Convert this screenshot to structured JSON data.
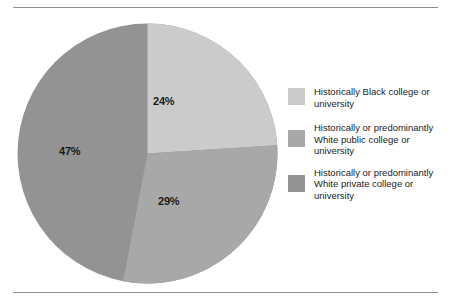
{
  "figure": {
    "background": "#ffffff",
    "rule_color": "#8e8e8e"
  },
  "chart_data": {
    "type": "pie",
    "title": "",
    "subtitle": "",
    "xlabel": "",
    "ylabel": "",
    "legend_position": "right",
    "grid": false,
    "start_angle_deg": 0,
    "direction": "clockwise",
    "categories": [
      "Historically Black college or university",
      "Historically or predominantly White public college or university",
      "Historically or predominantly White private college or university"
    ],
    "values": [
      24,
      29,
      47
    ],
    "value_labels": [
      "24%",
      "29%",
      "47%"
    ],
    "colors": [
      "#cbcbcb",
      "#a8a8a8",
      "#939393"
    ],
    "slices": [
      {
        "label": "Historically Black college or university",
        "value": 24,
        "value_label": "24%",
        "color": "#cbcbcb",
        "start_deg": 0,
        "end_deg": 86.4
      },
      {
        "label": "Historically or predominantly White public college or university",
        "value": 29,
        "value_label": "29%",
        "color": "#a8a8a8",
        "start_deg": 86.4,
        "end_deg": 190.8
      },
      {
        "label": "Historically or predominantly White private college or university",
        "value": 47,
        "value_label": "47%",
        "color": "#939393",
        "start_deg": 190.8,
        "end_deg": 360
      }
    ]
  },
  "pie": {
    "labels": {
      "slice_1": "24%",
      "slice_2": "29%",
      "slice_3": "47%"
    }
  },
  "legend": {
    "items": [
      {
        "label": "Historically Black college or\nuniversity",
        "color": "#cbcbcb"
      },
      {
        "label": "Historically or predominantly\nWhite public college or\nuniversity",
        "color": "#a8a8a8"
      },
      {
        "label": "Historically or predominantly\nWhite private college or\nuniversity",
        "color": "#939393"
      }
    ]
  }
}
